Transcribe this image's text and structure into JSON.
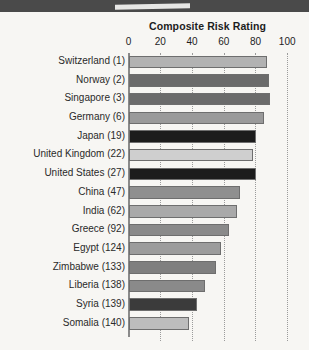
{
  "chart_data": {
    "type": "bar",
    "orientation": "horizontal",
    "title": "Composite Risk Rating",
    "xlabel": "",
    "ylabel": "",
    "xlim": [
      0,
      100
    ],
    "xticks": [
      0,
      20,
      40,
      60,
      80,
      100
    ],
    "xtick_labels": [
      "0",
      "20",
      "40",
      "60",
      "80",
      "100"
    ],
    "grid": "vertical-dotted",
    "legend": "none",
    "categories": [
      "Switzerland (1)",
      "Norway (2)",
      "Singapore (3)",
      "Germany (6)",
      "Japan (19)",
      "United Kingdom (22)",
      "United States (27)",
      "China (47)",
      "India (62)",
      "Greece (92)",
      "Egypt (124)",
      "Zimbabwe (133)",
      "Liberia (138)",
      "Syria (139)",
      "Somalia (140)"
    ],
    "values": [
      87,
      88,
      89,
      85,
      80,
      78,
      80,
      70,
      68,
      63,
      58,
      55,
      48,
      43,
      38
    ],
    "bar_colors": [
      "#b2b2b2",
      "#6b6b6b",
      "#6b6b6b",
      "#9a9a9a",
      "#1c1c1c",
      "#cfcfcf",
      "#1c1c1c",
      "#8f8f8f",
      "#a9a9a9",
      "#8a8a8a",
      "#9c9c9c",
      "#7f7f7f",
      "#8a8a8a",
      "#3b3b3b",
      "#bdbdbd"
    ]
  },
  "colors": {
    "background": "#f7f6f3",
    "header_band": "#4a4a4a",
    "axis": "#8a8a8a",
    "grid": "#9b9b9b",
    "text": "#1d1d1d"
  }
}
